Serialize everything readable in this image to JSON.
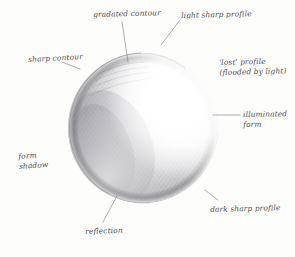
{
  "figure": {
    "medium": "graphite pencil on paper",
    "background_color": "#fdfdfc",
    "ink_color": "#4a4a4c",
    "leader_color": "#6a6a6d",
    "light_direction": "upper-right"
  },
  "sphere": {
    "center_x": 143,
    "center_y": 128,
    "radius": 75,
    "highlight_x": 181,
    "highlight_y": 92,
    "core_shadow_color": "#9a9a9c",
    "reflection_color": "#c9c9cb",
    "lit_color": "#ffffff"
  },
  "labels": [
    {
      "id": "gradated-contour",
      "text": "gradated contour",
      "lines": [
        "gradated contour"
      ],
      "x": 93,
      "y": 10,
      "rotate": -1.5,
      "align": "left"
    },
    {
      "id": "light-sharp-profile",
      "text": "light sharp profile",
      "lines": [
        "light sharp profile"
      ],
      "x": 181,
      "y": 11,
      "rotate": -1.5,
      "align": "left"
    },
    {
      "id": "sharp-contour",
      "text": "sharp contour",
      "lines": [
        "sharp contour"
      ],
      "x": 28,
      "y": 55,
      "rotate": -3,
      "align": "left"
    },
    {
      "id": "lost-profile",
      "text": "'lost' profile (flooded by light)",
      "lines": [
        "'lost' profile",
        "(flooded by light)"
      ],
      "x": 219,
      "y": 58,
      "rotate": -1.5,
      "align": "left"
    },
    {
      "id": "illuminated-form",
      "text": "illuminated form",
      "lines": [
        "illuminated",
        "form"
      ],
      "x": 243,
      "y": 110,
      "rotate": -1,
      "align": "left"
    },
    {
      "id": "form-shadow",
      "text": "form shadow",
      "lines": [
        "form",
        "shadow"
      ],
      "x": 18,
      "y": 152,
      "rotate": -4,
      "align": "left"
    },
    {
      "id": "dark-sharp-profile",
      "text": "dark sharp profile",
      "lines": [
        "dark sharp profile"
      ],
      "x": 210,
      "y": 205,
      "rotate": -1.5,
      "align": "left"
    },
    {
      "id": "reflection",
      "text": "reflection",
      "lines": [
        "reflection"
      ],
      "x": 85,
      "y": 227,
      "rotate": -2,
      "align": "left"
    }
  ],
  "leaders": [
    {
      "id": "leader-gradated-contour",
      "path": "M 122 22 L 128 62"
    },
    {
      "id": "leader-light-sharp-profile",
      "path": "M 180 20 L 161 45"
    },
    {
      "id": "leader-sharp-contour",
      "path": "M 62 62 L 80 69"
    },
    {
      "id": "leader-illuminated-form",
      "path": "M 213 115 L 240 115"
    },
    {
      "id": "leader-dark-sharp-profile",
      "path": "M 218 200 L 205 190"
    },
    {
      "id": "leader-reflection",
      "path": "M 103 222 L 117 196"
    }
  ]
}
